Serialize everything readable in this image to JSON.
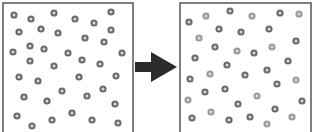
{
  "diagram": {
    "colors": {
      "border": "#555555",
      "arrow": "#2b2b2b",
      "particle_dark": "#6a6a6a",
      "particle_light": "#9a9a9a",
      "particle_center": "#d8d8d8"
    },
    "left_box": {
      "x": 3,
      "y": 3,
      "w": 130,
      "h": 135,
      "particles": [
        [
          14,
          15
        ],
        [
          31,
          19
        ],
        [
          54,
          13
        ],
        [
          75,
          19
        ],
        [
          94,
          23
        ],
        [
          111,
          12
        ],
        [
          19,
          32
        ],
        [
          41,
          29
        ],
        [
          58,
          33
        ],
        [
          85,
          38
        ],
        [
          104,
          42
        ],
        [
          111,
          30
        ],
        [
          13,
          52
        ],
        [
          30,
          46
        ],
        [
          44,
          49
        ],
        [
          68,
          53
        ],
        [
          82,
          60
        ],
        [
          100,
          64
        ],
        [
          122,
          53
        ],
        [
          30,
          61
        ],
        [
          54,
          66
        ],
        [
          19,
          77
        ],
        [
          38,
          81
        ],
        [
          79,
          77
        ],
        [
          116,
          76
        ],
        [
          24,
          97
        ],
        [
          47,
          101
        ],
        [
          62,
          91
        ],
        [
          87,
          96
        ],
        [
          103,
          89
        ],
        [
          115,
          104
        ],
        [
          17,
          116
        ],
        [
          32,
          126
        ],
        [
          52,
          120
        ],
        [
          72,
          113
        ],
        [
          92,
          120
        ],
        [
          118,
          123
        ]
      ]
    },
    "right_box": {
      "x": 180,
      "y": 3,
      "w": 131,
      "h": 135,
      "particles": [
        [
          189,
          22,
          "d"
        ],
        [
          206,
          16,
          "l"
        ],
        [
          230,
          11,
          "d"
        ],
        [
          252,
          16,
          "l"
        ],
        [
          280,
          13,
          "d"
        ],
        [
          299,
          14,
          "l"
        ],
        [
          199,
          38,
          "l"
        ],
        [
          219,
          29,
          "d"
        ],
        [
          241,
          32,
          "d"
        ],
        [
          269,
          29,
          "d"
        ],
        [
          296,
          41,
          "d"
        ],
        [
          215,
          47,
          "d"
        ],
        [
          237,
          51,
          "l"
        ],
        [
          254,
          53,
          "d"
        ],
        [
          272,
          47,
          "l"
        ],
        [
          288,
          61,
          "d"
        ],
        [
          195,
          58,
          "d"
        ],
        [
          227,
          65,
          "d"
        ],
        [
          267,
          70,
          "d"
        ],
        [
          190,
          79,
          "d"
        ],
        [
          210,
          74,
          "l"
        ],
        [
          245,
          75,
          "d"
        ],
        [
          277,
          84,
          "d"
        ],
        [
          296,
          80,
          "l"
        ],
        [
          205,
          92,
          "d"
        ],
        [
          225,
          89,
          "d"
        ],
        [
          257,
          96,
          "l"
        ],
        [
          188,
          100,
          "l"
        ],
        [
          238,
          104,
          "d"
        ],
        [
          302,
          101,
          "d"
        ],
        [
          275,
          109,
          "d"
        ],
        [
          192,
          118,
          "d"
        ],
        [
          211,
          112,
          "l"
        ],
        [
          229,
          120,
          "d"
        ],
        [
          250,
          117,
          "d"
        ],
        [
          267,
          124,
          "l"
        ],
        [
          292,
          117,
          "l"
        ]
      ]
    },
    "arrow": {
      "points": "135,62 151,62 151,52 177,67 151,82 151,72 135,72"
    }
  }
}
